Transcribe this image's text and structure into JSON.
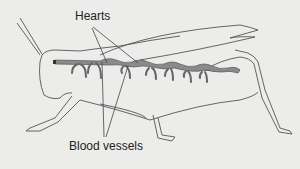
{
  "diagram": {
    "labels": {
      "hearts": "Hearts",
      "blood_vessels": "Blood vessels"
    },
    "colors": {
      "background": "#ececeb",
      "outline": "#555555",
      "vessel_fill": "#8a8a8a",
      "text": "#222222"
    }
  }
}
